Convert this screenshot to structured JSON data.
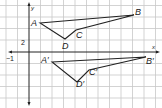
{
  "figure": {
    "axes": {
      "x_label": "x",
      "y_label": "y",
      "x_tick_label": "−1",
      "y_tick_label": "2"
    },
    "original_triangle": {
      "labels": {
        "A": "A",
        "B": "B",
        "C": "C",
        "D": "D"
      },
      "points_px": {
        "A": [
          40,
          23
        ],
        "B": [
          134,
          15
        ],
        "C": [
          76,
          30
        ],
        "D": [
          65,
          39
        ]
      }
    },
    "image_triangle": {
      "labels": {
        "A": "A′",
        "B": "B′",
        "C": "C′",
        "D": "D′"
      },
      "points_px": {
        "A": [
          52,
          62
        ],
        "B": [
          146,
          57
        ],
        "C": [
          89,
          70
        ],
        "D": [
          77,
          82
        ]
      }
    },
    "colors": {
      "grid": "#c8c8c8",
      "ink": "#222222",
      "background": "#ffffff"
    }
  }
}
